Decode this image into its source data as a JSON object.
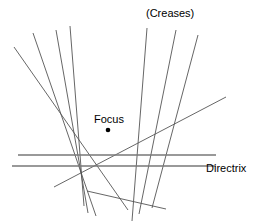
{
  "figure": {
    "width": 261,
    "height": 223,
    "background_color": "#ffffff",
    "line_color": "#555555",
    "directrix_color": "#777777",
    "point_color": "#000000"
  },
  "labels": {
    "creases": "(Creases)",
    "focus": "Focus",
    "directrix": "Directrix"
  },
  "chart_data": {
    "type": "scatter",
    "xlabel": "",
    "ylabel": "",
    "xlim": [
      0,
      261
    ],
    "ylim": [
      0,
      223
    ],
    "grid": false,
    "legend": "none",
    "focus_point": {
      "x": 108,
      "y": 130
    },
    "directrix_lines": [
      {
        "name": "directrix-upper",
        "x1": 18,
        "y1": 155,
        "x2": 216,
        "y2": 155
      },
      {
        "name": "directrix-lower",
        "x1": 12,
        "y1": 166,
        "x2": 216,
        "y2": 166
      }
    ],
    "crease_lines": [
      {
        "name": "crease-1",
        "x1": 14,
        "y1": 47,
        "x2": 128,
        "y2": 210
      },
      {
        "name": "crease-2",
        "x1": 33,
        "y1": 33,
        "x2": 96,
        "y2": 216
      },
      {
        "name": "crease-3",
        "x1": 56,
        "y1": 30,
        "x2": 88,
        "y2": 213
      },
      {
        "name": "crease-4",
        "x1": 70,
        "y1": 26,
        "x2": 84,
        "y2": 206
      },
      {
        "name": "crease-5",
        "x1": 147,
        "y1": 28,
        "x2": 132,
        "y2": 221
      },
      {
        "name": "crease-6",
        "x1": 176,
        "y1": 30,
        "x2": 139,
        "y2": 214
      },
      {
        "name": "crease-7",
        "x1": 198,
        "y1": 35,
        "x2": 152,
        "y2": 208
      },
      {
        "name": "crease-8",
        "x1": 54,
        "y1": 187,
        "x2": 226,
        "y2": 97
      },
      {
        "name": "crease-9",
        "x1": 87,
        "y1": 191,
        "x2": 166,
        "y2": 209
      }
    ]
  }
}
